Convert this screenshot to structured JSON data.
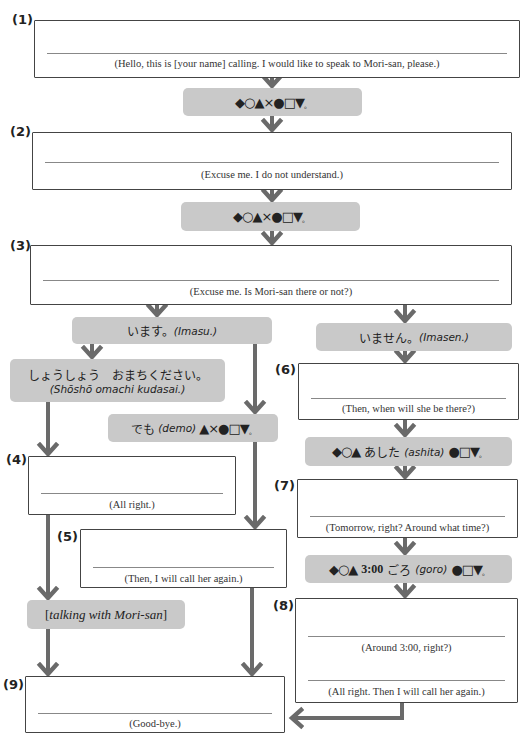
{
  "colors": {
    "arrow": "#6a6a6a",
    "pill_bg": "#c9c9c9",
    "border": "#444444"
  },
  "steps": {
    "s1": {
      "number": "(1)",
      "captions": [
        "(Hello, this is [your name] calling. I would like to speak to Mori-san, please.)"
      ]
    },
    "s2": {
      "number": "(2)",
      "captions": [
        "(Excuse me. I do not understand.)"
      ]
    },
    "s3": {
      "number": "(3)",
      "captions": [
        "(Excuse me. Is Mori-san there or not?)"
      ]
    },
    "s4": {
      "number": "(4)",
      "captions": [
        "(All right.)"
      ]
    },
    "s5": {
      "number": "(5)",
      "captions": [
        "(Then, I will call her again.)"
      ]
    },
    "s6": {
      "number": "(6)",
      "captions": [
        "(Then, when will she be there?)"
      ]
    },
    "s7": {
      "number": "(7)",
      "captions": [
        "(Tomorrow, right? Around what time?)"
      ]
    },
    "s8": {
      "number": "(8)",
      "captions": [
        "(Around 3:00, right?)",
        "(All right. Then I will call her again.)"
      ]
    },
    "s9": {
      "number": "(9)",
      "captions": [
        "(Good-bye.)"
      ]
    }
  },
  "responses": {
    "garbled_1": {
      "symbols": "◆○▲×●□▼",
      "end": "。"
    },
    "garbled_2": {
      "symbols": "◆○▲×●□▼",
      "end": "。"
    },
    "imasu": {
      "jp": "います。",
      "romaji": "(Imasu.)"
    },
    "imasen": {
      "jp": "いません。",
      "romaji": "(Imasen.)"
    },
    "shosho": {
      "jp": "しょうしょう　おまちください。",
      "romaji": "(Shōshō omachi kudasai.)"
    },
    "demo": {
      "jp": "でも",
      "romaji": "(demo)",
      "symbols": "▲×●□▼",
      "end": "。"
    },
    "ashita": {
      "symbols_pre": "◆○▲",
      "jp": "あした",
      "romaji": "(ashita)",
      "symbols_post": "●□▼",
      "end": "。"
    },
    "goro": {
      "symbols_pre": "◆○▲",
      "time": "3:00",
      "jp": "ごろ",
      "romaji": "(goro)",
      "symbols_post": "●□▼",
      "end": "。"
    },
    "talking": {
      "open": "[",
      "text": "talking with Mori-san",
      "close": "]"
    }
  }
}
